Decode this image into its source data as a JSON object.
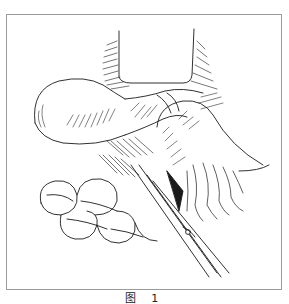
{
  "figure": {
    "caption": "图 1",
    "colors": {
      "frame": "#9a9a9a",
      "ink": "#1a1a1a",
      "background": "#ffffff"
    }
  }
}
